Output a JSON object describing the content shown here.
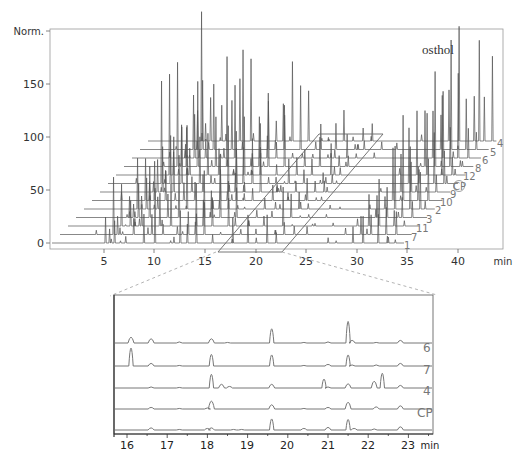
{
  "chart_data": [
    {
      "type": "line",
      "subtype": "stacked-3d-chromatogram",
      "title": "",
      "ylabel": "Norm.",
      "xlabel": "min",
      "xlim": [
        0,
        44
      ],
      "ylim": [
        0,
        200
      ],
      "xticks": [
        5,
        10,
        15,
        20,
        25,
        30,
        35,
        40
      ],
      "yticks": [
        0,
        50,
        100,
        150
      ],
      "grid": false,
      "annotation": {
        "text": "osthol",
        "x_min": 38.0,
        "trace": "4"
      },
      "series_order_front_to_back": [
        "1",
        "7",
        "11",
        "3",
        "2",
        "10",
        "9",
        "CP",
        "12",
        "8",
        "6",
        "5",
        "4"
      ],
      "highlighted_label": "CP",
      "zoom_region_min": [
        16,
        23
      ],
      "major_peaks_min": [
        5.1,
        6.3,
        7.5,
        9.3,
        10.4,
        12.9,
        13.6,
        14.5,
        16.1,
        18.1,
        19.6,
        21.5,
        22.4,
        30.0,
        31.0,
        32.5,
        33.5
      ],
      "approx_peak_heights": {
        "front_trace_1": [
          {
            "x": 5.5,
            "y": 78
          },
          {
            "x": 5.9,
            "y": 20
          },
          {
            "x": 7.5,
            "y": 12
          },
          {
            "x": 13.0,
            "y": 50
          }
        ],
        "back_trace_4": [
          {
            "x": 33.0,
            "y": 95
          },
          {
            "x": 34.3,
            "y": 80
          },
          {
            "x": 35.1,
            "y": 155
          },
          {
            "x": 36.0,
            "y": 140
          },
          {
            "x": 36.8,
            "y": 110
          },
          {
            "x": 37.7,
            "y": 85
          }
        ]
      }
    },
    {
      "type": "line",
      "subtype": "chromatogram-inset",
      "title": "",
      "xlabel": "min",
      "xlim": [
        15.7,
        23.6
      ],
      "xticks": [
        16,
        17,
        18,
        19,
        20,
        21,
        22,
        23
      ],
      "yticks": [],
      "series": [
        {
          "name": "6",
          "peaks": [
            {
              "x": 16.1,
              "h": 11
            },
            {
              "x": 16.6,
              "h": 8
            },
            {
              "x": 17.3,
              "h": 2
            },
            {
              "x": 18.1,
              "h": 8
            },
            {
              "x": 18.5,
              "h": 1
            },
            {
              "x": 19.6,
              "h": 27
            },
            {
              "x": 20.4,
              "h": 1
            },
            {
              "x": 21.0,
              "h": 2
            },
            {
              "x": 21.5,
              "h": 41
            },
            {
              "x": 21.6,
              "h": 5
            },
            {
              "x": 22.2,
              "h": 1
            },
            {
              "x": 22.8,
              "h": 5
            }
          ]
        },
        {
          "name": "7",
          "peaks": [
            {
              "x": 16.1,
              "h": 34
            },
            {
              "x": 16.6,
              "h": 5
            },
            {
              "x": 17.3,
              "h": 1
            },
            {
              "x": 18.1,
              "h": 22
            },
            {
              "x": 19.6,
              "h": 21
            },
            {
              "x": 20.4,
              "h": 1
            },
            {
              "x": 21.0,
              "h": 3
            },
            {
              "x": 21.5,
              "h": 21
            },
            {
              "x": 21.6,
              "h": 2
            },
            {
              "x": 22.2,
              "h": 2
            },
            {
              "x": 22.8,
              "h": 5
            }
          ]
        },
        {
          "name": "4",
          "peaks": [
            {
              "x": 16.6,
              "h": 2
            },
            {
              "x": 17.3,
              "h": 1
            },
            {
              "x": 18.1,
              "h": 26
            },
            {
              "x": 18.35,
              "h": 7
            },
            {
              "x": 18.55,
              "h": 3
            },
            {
              "x": 19.6,
              "h": 7
            },
            {
              "x": 20.9,
              "h": 17
            },
            {
              "x": 21.0,
              "h": 2
            },
            {
              "x": 21.5,
              "h": 8
            },
            {
              "x": 22.15,
              "h": 13
            },
            {
              "x": 22.35,
              "h": 28
            },
            {
              "x": 22.8,
              "h": 5
            }
          ]
        },
        {
          "name": "CP",
          "peaks": [
            {
              "x": 16.6,
              "h": 3
            },
            {
              "x": 17.3,
              "h": 1
            },
            {
              "x": 18.0,
              "h": 2
            },
            {
              "x": 18.1,
              "h": 15
            },
            {
              "x": 19.6,
              "h": 8
            },
            {
              "x": 20.4,
              "h": 1
            },
            {
              "x": 21.0,
              "h": 3
            },
            {
              "x": 21.5,
              "h": 13
            },
            {
              "x": 22.2,
              "h": 4
            },
            {
              "x": 22.8,
              "h": 6
            }
          ]
        },
        {
          "name": "",
          "peaks": [
            {
              "x": 16.6,
              "h": 4
            },
            {
              "x": 17.3,
              "h": 1
            },
            {
              "x": 18.0,
              "h": 3
            },
            {
              "x": 18.1,
              "h": 4
            },
            {
              "x": 18.65,
              "h": 1
            },
            {
              "x": 18.85,
              "h": 1
            },
            {
              "x": 19.6,
              "h": 21
            },
            {
              "x": 20.4,
              "h": 3
            },
            {
              "x": 21.0,
              "h": 5
            },
            {
              "x": 21.5,
              "h": 20
            },
            {
              "x": 21.65,
              "h": 3
            },
            {
              "x": 22.15,
              "h": 2
            },
            {
              "x": 22.8,
              "h": 6
            }
          ]
        }
      ]
    }
  ],
  "main": {
    "ylabel": "Norm.",
    "xunit": "min",
    "annotation": "osthol",
    "ytick_labels": [
      "0",
      "50",
      "100",
      "150"
    ],
    "xtick_labels": [
      "5",
      "10",
      "15",
      "20",
      "25",
      "30",
      "35",
      "40"
    ],
    "trace_labels": [
      "1",
      "7",
      "11",
      "3",
      "2",
      "10",
      "9",
      "CP",
      "12",
      "8",
      "6",
      "5",
      "4"
    ]
  },
  "inset": {
    "xunit": "min",
    "xtick_labels": [
      "16",
      "17",
      "18",
      "19",
      "20",
      "21",
      "22",
      "23"
    ],
    "trace_labels": [
      "6",
      "7",
      "4",
      "CP",
      ""
    ]
  },
  "colors": {
    "trace": "#555555",
    "axis": "#666666",
    "label": "#777777",
    "dashed": "#aaaaaa"
  }
}
